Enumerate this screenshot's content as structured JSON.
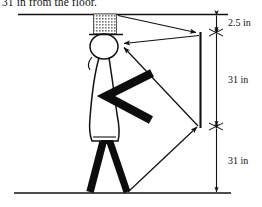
{
  "figure": {
    "caption": "31 in from the floor.",
    "type": "optics-ray-diagram",
    "colors": {
      "ink": "#111111",
      "hat_fill": "#9a9a9a",
      "limb": "#0d0d0d"
    },
    "scene": {
      "ceiling_label": "ceiling-line",
      "floor_label": "floor-line",
      "mirror_label": "mirror-line"
    },
    "dimensions": [
      {
        "label": "2.5 in",
        "from_y": 14,
        "to_y": 33
      },
      {
        "label": "31 in",
        "from_y": 33,
        "to_y": 127
      },
      {
        "label": "31 in",
        "from_y": 127,
        "to_y": 193
      }
    ],
    "rays": [
      {
        "name": "ceiling-to-mirror-ray",
        "label": "incident ray from ceiling to mirror top"
      },
      {
        "name": "mirror-to-eye-ray",
        "label": "reflected ray from mirror top to eye"
      },
      {
        "name": "eye-to-mirror-bottom-ray",
        "label": "ray from eye to mirror bottom"
      },
      {
        "name": "floor-to-mirror-bottom-ray",
        "label": "incident ray from floor to mirror bottom"
      }
    ],
    "person": {
      "name": "stick-figure-person",
      "parts": [
        "hat",
        "head",
        "torso",
        "arm",
        "left-leg",
        "right-leg"
      ]
    }
  }
}
